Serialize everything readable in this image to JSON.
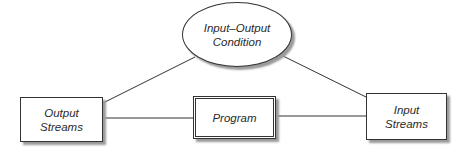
{
  "diagram": {
    "nodes": {
      "condition": {
        "line1": "Input–Output",
        "line2": "Condition",
        "shape": "ellipse"
      },
      "output_streams": {
        "line1": "Output",
        "line2": "Streams",
        "shape": "rectangle"
      },
      "program": {
        "label": "Program",
        "shape": "double-rectangle"
      },
      "input_streams": {
        "line1": "Input",
        "line2": "Streams",
        "shape": "rectangle"
      }
    },
    "edges": [
      {
        "from": "condition",
        "to": "output_streams"
      },
      {
        "from": "condition",
        "to": "input_streams"
      },
      {
        "from": "output_streams",
        "to": "program"
      },
      {
        "from": "program",
        "to": "input_streams"
      }
    ],
    "colors": {
      "stroke": "#333333",
      "shadow": "#9a9a9a",
      "text": "#2a2a2a"
    }
  }
}
